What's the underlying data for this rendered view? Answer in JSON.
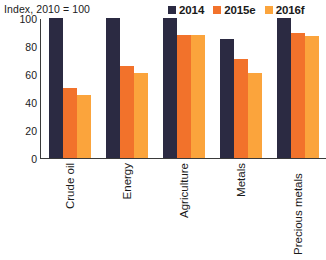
{
  "chart_data": {
    "type": "bar",
    "title": "Index, 2010 = 100",
    "xlabel": "",
    "ylabel": "Index, 2010 = 100",
    "categories": [
      "Crude oil",
      "Energy",
      "Agriculture",
      "Metals",
      "Precious metals"
    ],
    "series": [
      {
        "name": "2014",
        "color": "#2b2a42",
        "values": [
          100,
          100,
          100,
          85,
          100
        ]
      },
      {
        "name": "2015e",
        "color": "#f2722b",
        "values": [
          50,
          66,
          88,
          71,
          89
        ]
      },
      {
        "name": "2016f",
        "color": "#fba43c",
        "values": [
          45,
          61,
          88,
          61,
          87
        ]
      }
    ],
    "yticks": [
      100,
      80,
      60,
      40,
      20,
      0
    ],
    "ylim": [
      0,
      100
    ],
    "grid": false,
    "legend_position": "top-right"
  },
  "axis": {
    "note": "Index, 2010 = 100"
  },
  "legend": {
    "items": [
      {
        "label": "2014"
      },
      {
        "label": "2015e"
      },
      {
        "label": "2016f"
      }
    ]
  }
}
